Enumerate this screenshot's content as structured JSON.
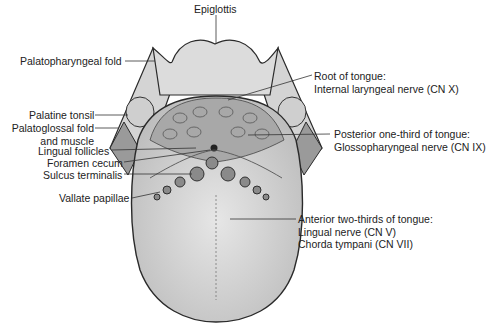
{
  "figure": {
    "labels_left": [
      {
        "id": "palatopharyngeal-fold",
        "text": "Palatopharyngeal fold"
      },
      {
        "id": "palatine-tonsil",
        "text": "Palatine tonsil"
      },
      {
        "id": "palatoglossal-fold",
        "line1": "Palatoglossal fold",
        "line2": "and muscle"
      },
      {
        "id": "lingual-follicles",
        "text": "Lingual follicles"
      },
      {
        "id": "foramen-cecum",
        "text": "Foramen cecum"
      },
      {
        "id": "sulcus-terminalis",
        "text": "Sulcus terminalis"
      },
      {
        "id": "vallate-papillae",
        "text": "Vallate papillae"
      }
    ],
    "label_top": {
      "id": "epiglottis",
      "text": "Epiglottis"
    },
    "labels_right": [
      {
        "id": "root-of-tongue",
        "line1": "Root of tongue:",
        "line2": "Internal laryngeal nerve (CN X)"
      },
      {
        "id": "posterior-third",
        "line1": "Posterior one-third of tongue:",
        "line2": "Glossopharyngeal nerve (CN IX)"
      },
      {
        "id": "anterior-two-thirds",
        "line1": "Anterior two-thirds of tongue:",
        "line2": "Lingual nerve (CN V)",
        "line3": "Chorda tympani (CN VII)"
      }
    ],
    "colors": {
      "outline": "#2a2a2a",
      "tongue_fill": "#d9d9d9",
      "root_fill": "#a9a9a9",
      "fold_fill": "#cfcfcf",
      "leader_line": "#333333"
    }
  }
}
